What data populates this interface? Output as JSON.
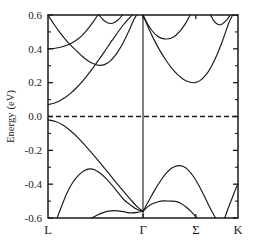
{
  "figure": {
    "background_color": "#ffffff",
    "line_color": "#1a1a1a",
    "frame_color": "#1a1a1a"
  },
  "axes": {
    "ylabel": "Energy (eV)",
    "xlabel": "",
    "ytick_labels": [
      "0.6",
      "0.4",
      "0.2",
      "0.0",
      "-0.2",
      "-0.4",
      "-0.6"
    ],
    "ytick_values": [
      0.6,
      0.4,
      0.2,
      0.0,
      -0.2,
      -0.4,
      -0.6
    ],
    "xtick_labels": [
      "L",
      "Γ",
      "Σ",
      "K"
    ]
  },
  "chart_data": {
    "type": "line",
    "title": "",
    "xlabel": "",
    "ylabel": "Energy (eV)",
    "ylim": [
      -0.6,
      0.6
    ],
    "grid": false,
    "legend_position": "none",
    "ytick_labels": [
      "0.6",
      "0.4",
      "0.2",
      "0.0",
      "-0.2",
      "-0.4",
      "-0.6"
    ],
    "ytick_values": [
      0.6,
      0.4,
      0.2,
      0.0,
      -0.2,
      -0.4,
      -0.6
    ],
    "yticks_minor_count_between": 1,
    "kpath_labels": [
      "L",
      "Γ",
      "Σ",
      "K"
    ],
    "kpath_positions": [
      0.0,
      0.5,
      0.778,
      1.0
    ],
    "fermi_level": {
      "value": 0.0,
      "style": "dashed",
      "label": ""
    },
    "series": [
      {
        "name": "conduction-band-1",
        "comment": "flat band from L at 0.40 eV, crosses and rises steeply to 0.6 before Gamma",
        "points": [
          [
            0.0,
            0.4
          ],
          [
            0.03,
            0.402
          ],
          [
            0.06,
            0.408
          ],
          [
            0.09,
            0.418
          ],
          [
            0.12,
            0.432
          ],
          [
            0.15,
            0.452
          ],
          [
            0.18,
            0.48
          ],
          [
            0.21,
            0.518
          ],
          [
            0.24,
            0.562
          ],
          [
            0.262,
            0.6
          ]
        ]
      },
      {
        "name": "conduction-band-2",
        "comment": "descends from 0.6 at left, minimum 0.30 eV near k=0.27, rises steeply to 0.6 at Gamma",
        "points": [
          [
            0.0,
            0.6
          ],
          [
            0.03,
            0.548
          ],
          [
            0.06,
            0.5
          ],
          [
            0.09,
            0.458
          ],
          [
            0.12,
            0.42
          ],
          [
            0.15,
            0.388
          ],
          [
            0.18,
            0.356
          ],
          [
            0.21,
            0.33
          ],
          [
            0.24,
            0.312
          ],
          [
            0.27,
            0.302
          ],
          [
            0.3,
            0.308
          ],
          [
            0.33,
            0.33
          ],
          [
            0.36,
            0.37
          ],
          [
            0.39,
            0.424
          ],
          [
            0.42,
            0.492
          ],
          [
            0.45,
            0.568
          ],
          [
            0.466,
            0.6
          ]
        ]
      },
      {
        "name": "conduction-band-3",
        "comment": "rises from 0.07 eV at L monotonically up to 0.6 eV near Gamma",
        "points": [
          [
            0.0,
            0.07
          ],
          [
            0.03,
            0.078
          ],
          [
            0.06,
            0.092
          ],
          [
            0.09,
            0.112
          ],
          [
            0.12,
            0.138
          ],
          [
            0.15,
            0.17
          ],
          [
            0.18,
            0.206
          ],
          [
            0.21,
            0.248
          ],
          [
            0.24,
            0.292
          ],
          [
            0.27,
            0.34
          ],
          [
            0.3,
            0.388
          ],
          [
            0.33,
            0.438
          ],
          [
            0.36,
            0.486
          ],
          [
            0.39,
            0.532
          ],
          [
            0.42,
            0.572
          ],
          [
            0.443,
            0.6
          ]
        ]
      },
      {
        "name": "conduction-band-4",
        "comment": "shallow dip near k=0.33 with minimum 0.55 eV, re-touches 0.6",
        "points": [
          [
            0.268,
            0.6
          ],
          [
            0.29,
            0.572
          ],
          [
            0.31,
            0.556
          ],
          [
            0.33,
            0.55
          ],
          [
            0.35,
            0.556
          ],
          [
            0.37,
            0.572
          ],
          [
            0.392,
            0.6
          ]
        ]
      },
      {
        "name": "conduction-band-5",
        "comment": "from 0.6 at Gamma, deep minimum 0.20 eV just before Sigma, rises back to 0.6 past Sigma",
        "points": [
          [
            0.5,
            0.6
          ],
          [
            0.53,
            0.52
          ],
          [
            0.56,
            0.45
          ],
          [
            0.59,
            0.388
          ],
          [
            0.62,
            0.334
          ],
          [
            0.65,
            0.288
          ],
          [
            0.68,
            0.25
          ],
          [
            0.71,
            0.222
          ],
          [
            0.74,
            0.205
          ],
          [
            0.77,
            0.2
          ],
          [
            0.8,
            0.212
          ],
          [
            0.83,
            0.244
          ],
          [
            0.86,
            0.296
          ],
          [
            0.89,
            0.366
          ],
          [
            0.92,
            0.452
          ],
          [
            0.95,
            0.548
          ],
          [
            0.972,
            0.6
          ]
        ]
      },
      {
        "name": "conduction-band-6",
        "comment": "from 0.6 at Gamma, shallow minimum 0.46 eV near k=0.625",
        "points": [
          [
            0.5,
            0.6
          ],
          [
            0.525,
            0.545
          ],
          [
            0.55,
            0.504
          ],
          [
            0.575,
            0.476
          ],
          [
            0.6,
            0.462
          ],
          [
            0.625,
            0.458
          ],
          [
            0.65,
            0.464
          ],
          [
            0.675,
            0.482
          ],
          [
            0.7,
            0.512
          ],
          [
            0.725,
            0.552
          ],
          [
            0.748,
            0.6
          ]
        ]
      },
      {
        "name": "conduction-band-7",
        "comment": "shallow dip near k=0.90 with minimum 0.54 eV close to right edge",
        "points": [
          [
            0.855,
            0.6
          ],
          [
            0.875,
            0.562
          ],
          [
            0.895,
            0.544
          ],
          [
            0.915,
            0.546
          ],
          [
            0.94,
            0.57
          ],
          [
            0.96,
            0.6
          ]
        ]
      },
      {
        "name": "valence-band-1",
        "comment": "top valence band: -0.02 eV at L descending to -0.56 eV at Gamma",
        "points": [
          [
            0.0,
            -0.02
          ],
          [
            0.04,
            -0.03
          ],
          [
            0.08,
            -0.052
          ],
          [
            0.12,
            -0.086
          ],
          [
            0.16,
            -0.128
          ],
          [
            0.2,
            -0.176
          ],
          [
            0.24,
            -0.228
          ],
          [
            0.28,
            -0.282
          ],
          [
            0.32,
            -0.336
          ],
          [
            0.36,
            -0.392
          ],
          [
            0.4,
            -0.446
          ],
          [
            0.44,
            -0.498
          ],
          [
            0.47,
            -0.534
          ],
          [
            0.5,
            -0.56
          ]
        ]
      },
      {
        "name": "valence-band-2",
        "comment": "rises from -0.6 near L to hump -0.31 eV at k=0.22 then down to Gamma",
        "points": [
          [
            0.048,
            -0.6
          ],
          [
            0.075,
            -0.52
          ],
          [
            0.1,
            -0.452
          ],
          [
            0.13,
            -0.39
          ],
          [
            0.16,
            -0.348
          ],
          [
            0.19,
            -0.32
          ],
          [
            0.22,
            -0.31
          ],
          [
            0.25,
            -0.318
          ],
          [
            0.28,
            -0.34
          ],
          [
            0.31,
            -0.372
          ],
          [
            0.34,
            -0.41
          ],
          [
            0.37,
            -0.452
          ],
          [
            0.4,
            -0.492
          ],
          [
            0.44,
            -0.528
          ],
          [
            0.47,
            -0.55
          ],
          [
            0.5,
            -0.56
          ]
        ]
      },
      {
        "name": "valence-band-3",
        "comment": "low band with small hump -0.555 eV near k=0.36, nearly flat into Gamma",
        "points": [
          [
            0.23,
            -0.6
          ],
          [
            0.26,
            -0.582
          ],
          [
            0.29,
            -0.568
          ],
          [
            0.32,
            -0.559
          ],
          [
            0.35,
            -0.556
          ],
          [
            0.38,
            -0.559
          ],
          [
            0.41,
            -0.566
          ],
          [
            0.44,
            -0.57
          ],
          [
            0.47,
            -0.567
          ],
          [
            0.5,
            -0.56
          ]
        ]
      },
      {
        "name": "valence-band-4",
        "comment": "right of Gamma: hump -0.29 eV near k=0.70 then steep drop to -0.6 before K",
        "points": [
          [
            0.5,
            -0.56
          ],
          [
            0.53,
            -0.5
          ],
          [
            0.56,
            -0.438
          ],
          [
            0.59,
            -0.384
          ],
          [
            0.62,
            -0.338
          ],
          [
            0.65,
            -0.306
          ],
          [
            0.68,
            -0.292
          ],
          [
            0.71,
            -0.294
          ],
          [
            0.74,
            -0.318
          ],
          [
            0.77,
            -0.362
          ],
          [
            0.8,
            -0.42
          ],
          [
            0.83,
            -0.488
          ],
          [
            0.86,
            -0.556
          ],
          [
            0.882,
            -0.6
          ]
        ]
      },
      {
        "name": "valence-band-5",
        "comment": "right of Gamma: lower hump -0.50 eV near k=0.67 then drop to -0.6",
        "points": [
          [
            0.5,
            -0.56
          ],
          [
            0.525,
            -0.534
          ],
          [
            0.55,
            -0.516
          ],
          [
            0.58,
            -0.504
          ],
          [
            0.61,
            -0.499
          ],
          [
            0.64,
            -0.5
          ],
          [
            0.67,
            -0.502
          ],
          [
            0.7,
            -0.514
          ],
          [
            0.73,
            -0.538
          ],
          [
            0.76,
            -0.57
          ],
          [
            0.783,
            -0.6
          ]
        ]
      },
      {
        "name": "valence-band-6",
        "comment": "rises steeply from -0.6 near k=0.93 up to -0.40 eV at K",
        "points": [
          [
            0.93,
            -0.6
          ],
          [
            0.95,
            -0.538
          ],
          [
            0.97,
            -0.48
          ],
          [
            0.985,
            -0.436
          ],
          [
            1.0,
            -0.4
          ]
        ]
      }
    ]
  }
}
